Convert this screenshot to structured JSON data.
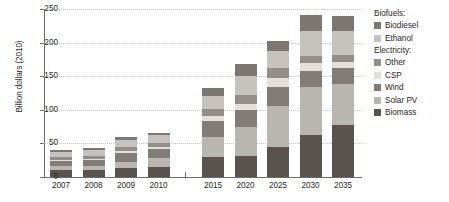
{
  "chart_data": {
    "type": "bar",
    "stacked": true,
    "title": "",
    "subtitle": "",
    "xlabel": "",
    "ylabel": "Billion dollars (2010)",
    "ylim": [
      0,
      250
    ],
    "yticks": [
      0,
      50,
      100,
      150,
      200,
      250
    ],
    "ytick_labels": [
      "0",
      "50",
      "100",
      "150",
      "200",
      "250"
    ],
    "grid": true,
    "grid_axis": "y",
    "legend_position": "right",
    "axis_break_after_category": "2010",
    "categories": [
      "2007",
      "2008",
      "2009",
      "2010",
      "2015",
      "2020",
      "2025",
      "2030",
      "2035"
    ],
    "series": [
      {
        "name": "Biomass",
        "group": "Electricity",
        "color": "#59524e",
        "values": [
          11,
          10,
          13,
          15,
          30,
          31,
          44,
          62,
          77
        ]
      },
      {
        "name": "Solar PV",
        "group": "Electricity",
        "color": "#b9b5b0",
        "values": [
          6,
          7,
          10,
          13,
          30,
          44,
          61,
          72,
          62
        ]
      },
      {
        "name": "Wind",
        "group": "Electricity",
        "color": "#817c78",
        "values": [
          7,
          8,
          12,
          13,
          23,
          24,
          29,
          24,
          23
        ]
      },
      {
        "name": "CSP",
        "group": "Electricity",
        "color": "#e3e0dc",
        "values": [
          2,
          2,
          3,
          4,
          8,
          10,
          13,
          11,
          9
        ]
      },
      {
        "name": "Other",
        "group": "Electricity",
        "color": "#938e8a",
        "values": [
          4,
          5,
          6,
          6,
          10,
          13,
          15,
          11,
          11
        ]
      },
      {
        "name": "Ethanol",
        "group": "Biofuels",
        "color": "#c6c2bd",
        "values": [
          7,
          8,
          11,
          11,
          20,
          28,
          26,
          38,
          36
        ]
      },
      {
        "name": "Biodiesel",
        "group": "Biofuels",
        "color": "#7c7773",
        "values": [
          3,
          3,
          4,
          4,
          11,
          18,
          15,
          23,
          22
        ]
      }
    ],
    "totals": [
      40,
      43,
      59,
      66,
      132,
      168,
      203,
      241,
      240
    ]
  },
  "legend": {
    "groups": [
      {
        "header": "Biofuels:",
        "items": [
          {
            "label": "Biodiesel",
            "color": "#7c7773"
          },
          {
            "label": "Ethanol",
            "color": "#c6c2bd"
          }
        ]
      },
      {
        "header": "Electricity:",
        "items": [
          {
            "label": "Other",
            "color": "#938e8a"
          },
          {
            "label": "CSP",
            "color": "#e3e0dc"
          },
          {
            "label": "Wind",
            "color": "#817c78"
          },
          {
            "label": "Solar PV",
            "color": "#b9b5b0"
          },
          {
            "label": "Biomass",
            "color": "#59524e"
          }
        ]
      }
    ]
  }
}
